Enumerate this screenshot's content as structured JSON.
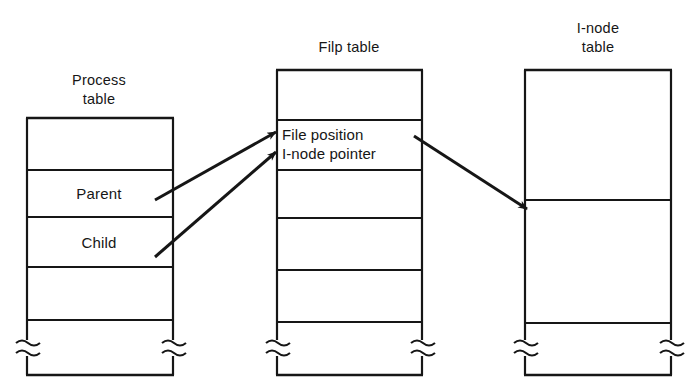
{
  "figure": {
    "title_process_line1": "Process",
    "title_process_line2": "table",
    "title_filp": "Filp table",
    "title_inode_line1": "I-node",
    "title_inode_line2": "table",
    "ink_color": "#161616",
    "background_color": "#ffffff"
  },
  "process_table": {
    "name": "Process table",
    "rows": [
      {
        "label": ""
      },
      {
        "label": "Parent"
      },
      {
        "label": "Child"
      },
      {
        "label": ""
      },
      {
        "label": ""
      }
    ]
  },
  "filp_table": {
    "name": "Filp table",
    "rows": [
      {
        "label": ""
      },
      {
        "label_line1": "File position",
        "label_line2": "I-node pointer"
      },
      {
        "label": ""
      },
      {
        "label": ""
      },
      {
        "label": ""
      },
      {
        "label": ""
      }
    ]
  },
  "inode_table": {
    "name": "I-node table",
    "rows": [
      {
        "label": ""
      },
      {
        "label": ""
      },
      {
        "label": ""
      }
    ]
  },
  "arrows": [
    {
      "name": "parent-to-filp",
      "from": "Parent",
      "to": "File position"
    },
    {
      "name": "child-to-filp",
      "from": "Child",
      "to": "I-node pointer"
    },
    {
      "name": "filp-to-inode",
      "from": "I-node pointer",
      "to": "I-node table entry"
    }
  ]
}
